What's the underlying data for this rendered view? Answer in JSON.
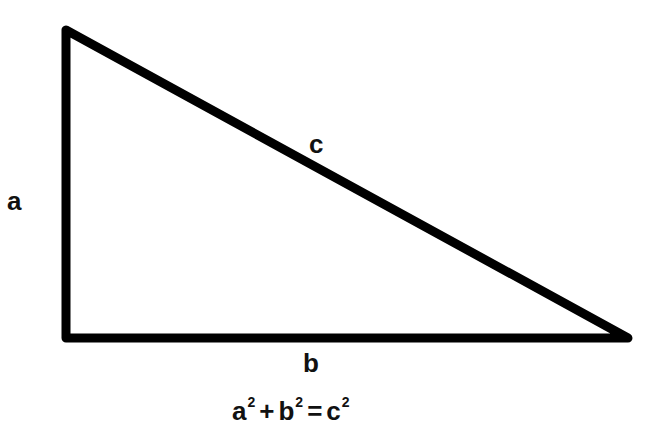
{
  "diagram": {
    "stroke_color": "#000000",
    "background": "#ffffff",
    "vertices": {
      "top_left": [
        66,
        30
      ],
      "bottom_left": [
        66,
        338
      ],
      "bottom_right": [
        628,
        338
      ]
    },
    "sides": {
      "a": {
        "label": "a",
        "description": "vertical leg"
      },
      "b": {
        "label": "b",
        "description": "horizontal leg"
      },
      "c": {
        "label": "c",
        "description": "hypotenuse"
      }
    },
    "formula": {
      "a": "a",
      "b": "b",
      "c": "c",
      "exp": "2",
      "plus": "+",
      "equals": "="
    }
  }
}
